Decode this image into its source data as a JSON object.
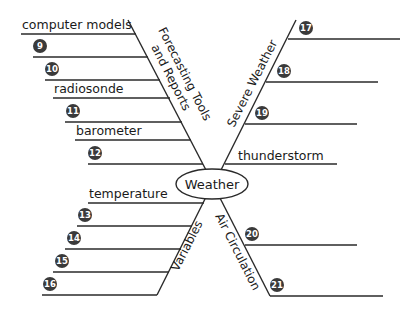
{
  "diagram": {
    "center": {
      "label": "Weather"
    },
    "branches": {
      "forecasting": {
        "title_line1": "Forecasting Tools",
        "title_line2": "and Reports",
        "items": [
          {
            "type": "text",
            "label": "computer models"
          },
          {
            "type": "number",
            "label": "9"
          },
          {
            "type": "number",
            "label": "10"
          },
          {
            "type": "text",
            "label": "radiosonde"
          },
          {
            "type": "number",
            "label": "11"
          },
          {
            "type": "text",
            "label": "barometer"
          },
          {
            "type": "number",
            "label": "12"
          }
        ]
      },
      "severe": {
        "title": "Severe Weather",
        "items": [
          {
            "type": "number",
            "label": "17"
          },
          {
            "type": "number",
            "label": "18"
          },
          {
            "type": "number",
            "label": "19"
          },
          {
            "type": "text",
            "label": "thunderstorm"
          }
        ]
      },
      "variables": {
        "title": "Variables",
        "items": [
          {
            "type": "text",
            "label": "temperature"
          },
          {
            "type": "number",
            "label": "13"
          },
          {
            "type": "number",
            "label": "14"
          },
          {
            "type": "number",
            "label": "15"
          },
          {
            "type": "number",
            "label": "16"
          }
        ]
      },
      "air": {
        "title": "Air Circulation",
        "items": [
          {
            "type": "number",
            "label": "20"
          },
          {
            "type": "number",
            "label": "21"
          }
        ]
      }
    },
    "colors": {
      "line": "#2a2a2a",
      "badge": "#3a3a3a",
      "badge_text": "#ffffff"
    }
  }
}
